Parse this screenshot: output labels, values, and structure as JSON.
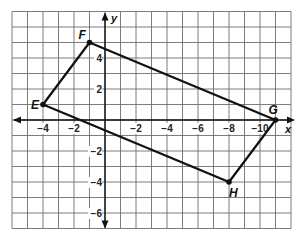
{
  "figure": {
    "type": "coordinate-plane-quadrilateral",
    "axes": {
      "x_label": "x",
      "y_label": "y",
      "x_range": [
        -6,
        12
      ],
      "y_range": [
        -7,
        7
      ],
      "grid_spacing": 1,
      "x_tick_labels": [
        {
          "value": -4,
          "text": "−4"
        },
        {
          "value": -2,
          "text": "−2"
        },
        {
          "value": 2,
          "text": "−2"
        },
        {
          "value": 4,
          "text": "−4"
        },
        {
          "value": 6,
          "text": "−6"
        },
        {
          "value": 8,
          "text": "−8"
        },
        {
          "value": 10,
          "text": "−10"
        }
      ],
      "y_tick_labels": [
        {
          "value": 4,
          "text": "4"
        },
        {
          "value": 2,
          "text": "2"
        },
        {
          "value": -2,
          "text": "−2"
        },
        {
          "value": -4,
          "text": "−4"
        },
        {
          "value": -6,
          "text": "−6"
        }
      ]
    },
    "vertices": [
      {
        "name": "E",
        "x": -4,
        "y": 1
      },
      {
        "name": "F",
        "x": -1,
        "y": 5
      },
      {
        "name": "G",
        "x": 11,
        "y": 0
      },
      {
        "name": "H",
        "x": 8,
        "y": -4
      }
    ],
    "polygon_order": [
      "E",
      "F",
      "G",
      "H"
    ],
    "colors": {
      "grid": "#6e6e6e",
      "axis": "#111111",
      "edge": "#111111"
    }
  }
}
